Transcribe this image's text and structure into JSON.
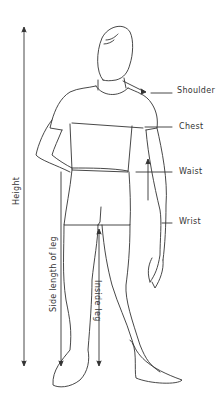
{
  "diagram": {
    "type": "body-measurement-guide",
    "labels": {
      "shoulder": "Shoulder",
      "chest": "Chest",
      "waist": "Waist",
      "wrist": "Wrist",
      "height": "Height",
      "side_leg": "Side length of leg",
      "inside_leg": "Inside leg"
    },
    "colors": {
      "line": "#333333",
      "background": "#ffffff"
    }
  }
}
